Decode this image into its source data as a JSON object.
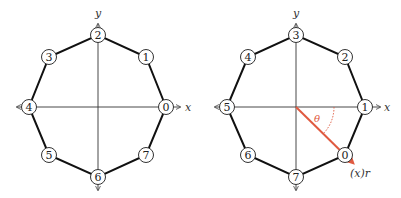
{
  "diagrams": [
    {
      "name": "octagon-left",
      "axis_x_label": "x",
      "axis_y_label": "y",
      "nodes": [
        "0",
        "1",
        "2",
        "3",
        "4",
        "5",
        "6",
        "7"
      ]
    },
    {
      "name": "octagon-right",
      "axis_x_label": "x",
      "axis_y_label": "y",
      "nodes": [
        "0",
        "1",
        "2",
        "3",
        "4",
        "5",
        "6",
        "7"
      ],
      "angle_label": "θ",
      "vector_label": "(x)r",
      "accent_color": "#e05a40"
    }
  ]
}
